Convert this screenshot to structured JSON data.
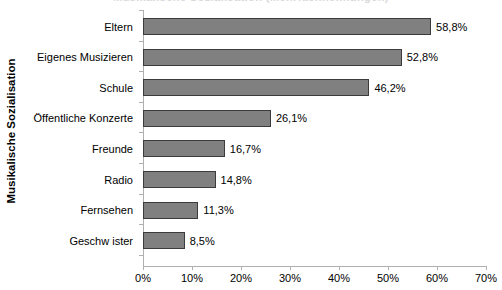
{
  "chart_data": {
    "type": "bar",
    "orientation": "horizontal",
    "title": "",
    "xlabel": "",
    "ylabel": "Musikalische Sozialisation",
    "categories": [
      "Eltern",
      "Eigenes Musizieren",
      "Schule",
      "Öffentliche Konzerte",
      "Freunde",
      "Radio",
      "Fernsehen",
      "Geschw ister"
    ],
    "values": [
      58.8,
      52.8,
      46.2,
      26.1,
      16.7,
      14.8,
      11.3,
      8.5
    ],
    "value_labels": [
      "58,8%",
      "52,8%",
      "46,2%",
      "26,1%",
      "16,7%",
      "14,8%",
      "11,3%",
      "8,5%"
    ],
    "xlim": [
      0,
      70
    ],
    "xticks": [
      0,
      10,
      20,
      30,
      40,
      50,
      60,
      70
    ],
    "xtick_labels": [
      "0%",
      "10%",
      "20%",
      "30%",
      "40%",
      "50%",
      "60%",
      "70%"
    ],
    "grid": false,
    "legend": false,
    "bar_color": "#808080",
    "bar_border_color": "#3b3b3b",
    "axis_color": "#b0b0b0",
    "background": "#ffffff"
  },
  "clipped_title": "Musikalische Sozialisation (Mehrfachnennungen)"
}
